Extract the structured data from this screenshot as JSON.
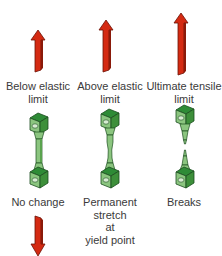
{
  "diagram": {
    "columns": [
      {
        "stage_label_line1": "Below elastic",
        "stage_label_line2": "limit",
        "result_label_line1": "No change",
        "arrow": "up-arrow-short"
      },
      {
        "stage_label_line1": "Above elastic",
        "stage_label_line2": "limit",
        "result_label_line1": "Permanent",
        "result_label_line2": "stretch",
        "result_label_line3": "at",
        "result_label_line4": "yield point",
        "arrow": "up-arrow-medium"
      },
      {
        "stage_label_line1": "Ultimate tensile",
        "stage_label_line2": "limit",
        "result_label_line1": "Breaks",
        "arrow": "up-arrow-long"
      }
    ],
    "bottom_arrow": "down-arrow",
    "colors": {
      "arrow_red": "#d42a12",
      "arrow_dark": "#7a1408",
      "specimen_dark": "#2e7d32",
      "specimen_light": "#8bc57f",
      "specimen_mid": "#5aa34e"
    }
  }
}
